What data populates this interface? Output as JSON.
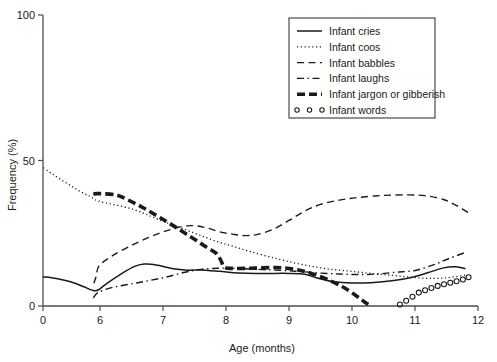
{
  "chart_data": {
    "type": "line",
    "title": "",
    "xlabel": "Age (months)",
    "ylabel": "Frequency (%)",
    "xlim": [
      0,
      12
    ],
    "ylim": [
      0,
      100
    ],
    "xticks": [
      0,
      6,
      7,
      8,
      9,
      10,
      11,
      12
    ],
    "xtick_labels": [
      "0",
      "6",
      "7",
      "8",
      "9",
      "10",
      "11",
      "12"
    ],
    "yticks": [
      0,
      50,
      100
    ],
    "ytick_labels": [
      "0",
      "50",
      "100"
    ],
    "grid": false,
    "legend_position": "top-right",
    "series": [
      {
        "name": "Infant cries",
        "style": "solid",
        "x": [
          0,
          0.9,
          2.0,
          3.2,
          4.3,
          5.3,
          5.8,
          6.1,
          6.35,
          6.55,
          6.7,
          6.85,
          7.0,
          7.2,
          7.4,
          7.6,
          7.9,
          8.2,
          8.6,
          9.0,
          9.25,
          9.45,
          9.7,
          10.0,
          10.3,
          10.6,
          10.9,
          11.2,
          11.45,
          11.65,
          11.8
        ],
        "y": [
          10.0,
          9.7,
          9.0,
          8.0,
          6.6,
          5.3,
          5.5,
          7.6,
          11.2,
          13.6,
          14.4,
          14.3,
          13.6,
          12.7,
          12.3,
          12.4,
          11.9,
          11.3,
          11.2,
          11.2,
          10.9,
          9.6,
          8.4,
          7.9,
          8.0,
          8.6,
          9.6,
          11.4,
          13.1,
          13.5,
          12.8
        ]
      },
      {
        "name": "Infant coos",
        "style": "dotted",
        "x": [
          0.05,
          0.8,
          1.8,
          2.9,
          4.0,
          5.0,
          5.9,
          6.5,
          6.9,
          7.1,
          7.35,
          7.6,
          7.85,
          8.1,
          8.4,
          8.8,
          9.2,
          9.6,
          10.0,
          10.4,
          10.75,
          11.1,
          11.45,
          11.8
        ],
        "y": [
          47.5,
          45.8,
          43.6,
          41.4,
          39.2,
          37.6,
          36.0,
          33.4,
          30.0,
          28.3,
          26.3,
          24.2,
          22.2,
          20.6,
          18.6,
          16.3,
          14.3,
          12.8,
          11.9,
          11.0,
          10.3,
          9.6,
          9.6,
          10.6
        ]
      },
      {
        "name": "Infant babbles",
        "style": "dashed",
        "x": [
          5.35,
          5.6,
          5.9,
          6.2,
          6.5,
          6.8,
          7.05,
          7.3,
          7.5,
          7.7,
          7.9,
          8.1,
          8.3,
          8.5,
          8.75,
          9.0,
          9.25,
          9.5,
          9.8,
          10.1,
          10.5,
          10.9,
          11.2,
          11.45,
          11.6,
          11.75,
          11.85
        ],
        "y": [
          7.8,
          10.2,
          13.8,
          17.3,
          20.8,
          23.8,
          25.8,
          27.3,
          27.6,
          26.8,
          25.5,
          24.7,
          24.2,
          24.6,
          26.4,
          29.4,
          32.6,
          34.9,
          36.4,
          37.3,
          38.0,
          38.2,
          37.8,
          36.6,
          35.2,
          33.4,
          32.0
        ]
      },
      {
        "name": "Infant laughs",
        "style": "dashdot",
        "x": [
          5.3,
          5.8,
          6.2,
          6.6,
          7.0,
          7.35,
          7.6,
          7.9,
          8.2,
          8.5,
          8.9,
          9.2,
          9.5,
          9.8,
          10.1,
          10.4,
          10.7,
          11.0,
          11.3,
          11.55,
          11.8
        ],
        "y": [
          2.8,
          4.6,
          6.4,
          8.0,
          9.7,
          11.6,
          12.6,
          13.0,
          12.9,
          12.6,
          12.2,
          11.8,
          11.3,
          11.0,
          10.8,
          11.0,
          11.6,
          12.2,
          14.2,
          16.4,
          18.4
        ]
      },
      {
        "name": "Infant jargon or gibberish",
        "style": "thick-dashed",
        "x": [
          5.3,
          5.7,
          6.0,
          6.25,
          6.45,
          6.7,
          6.95,
          7.2,
          7.45,
          7.7,
          7.85,
          7.92,
          7.98,
          8.15,
          8.45,
          8.8,
          9.1,
          9.35,
          9.6,
          9.85,
          10.05,
          10.2,
          10.3
        ],
        "y": [
          38.5,
          38.6,
          38.6,
          38.2,
          36.4,
          33.6,
          30.4,
          27.1,
          23.6,
          20.1,
          18.0,
          15.6,
          13.3,
          12.9,
          13.0,
          13.2,
          12.6,
          11.2,
          9.2,
          6.6,
          3.8,
          1.4,
          0.0
        ]
      },
      {
        "name": "Infant words",
        "style": "dot-circles",
        "x": [
          10.76,
          10.86,
          10.96,
          11.06,
          11.16,
          11.26,
          11.36,
          11.46,
          11.56,
          11.66,
          11.76,
          11.85
        ],
        "y": [
          0.5,
          1.8,
          3.2,
          4.6,
          5.4,
          6.2,
          6.9,
          7.5,
          8.0,
          8.5,
          9.1,
          9.9
        ]
      }
    ]
  },
  "legend": {
    "items": [
      {
        "label": "Infant cries",
        "style": "solid"
      },
      {
        "label": "Infant coos",
        "style": "dotted"
      },
      {
        "label": "Infant babbles",
        "style": "dashed"
      },
      {
        "label": "Infant laughs",
        "style": "dashdot"
      },
      {
        "label": "Infant jargon or gibberish",
        "style": "thick-dashed"
      },
      {
        "label": "Infant words",
        "style": "dot-circles"
      }
    ]
  },
  "colors": {
    "ink": "#1a1a1a",
    "axis": "#4d4d4d",
    "background": "#ffffff"
  }
}
